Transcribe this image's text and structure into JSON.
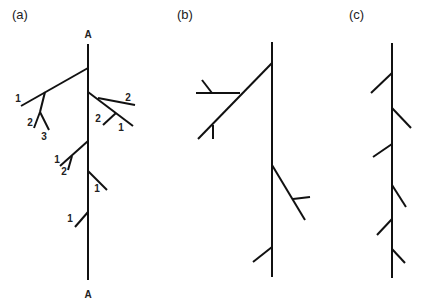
{
  "figure": {
    "stroke_color": "#111111",
    "background": "#ffffff",
    "panels": [
      {
        "id": "a",
        "label": "(a)",
        "label_pos": [
          12,
          19
        ],
        "axis_labels": [
          {
            "text": "A",
            "pos": [
              88,
              38
            ]
          },
          {
            "text": "A",
            "pos": [
              88,
              298
            ]
          }
        ],
        "segments": [
          {
            "role": "main-axis",
            "x1": 88,
            "y1": 44,
            "x2": 88,
            "y2": 280
          },
          {
            "role": "branch",
            "x1": 88,
            "y1": 68,
            "x2": 21,
            "y2": 106
          },
          {
            "role": "branch",
            "x1": 45,
            "y1": 92,
            "x2": 40,
            "y2": 112
          },
          {
            "role": "branch",
            "x1": 40,
            "y1": 112,
            "x2": 34,
            "y2": 128
          },
          {
            "role": "branch",
            "x1": 40,
            "y1": 112,
            "x2": 49,
            "y2": 130
          },
          {
            "role": "branch",
            "x1": 88,
            "y1": 92,
            "x2": 133,
            "y2": 126
          },
          {
            "role": "branch",
            "x1": 98,
            "y1": 98,
            "x2": 135,
            "y2": 105
          },
          {
            "role": "branch",
            "x1": 116,
            "y1": 113,
            "x2": 103,
            "y2": 125
          },
          {
            "role": "branch",
            "x1": 88,
            "y1": 141,
            "x2": 60,
            "y2": 166
          },
          {
            "role": "branch",
            "x1": 72,
            "y1": 156,
            "x2": 68,
            "y2": 170
          },
          {
            "role": "branch",
            "x1": 88,
            "y1": 171,
            "x2": 107,
            "y2": 190
          },
          {
            "role": "branch",
            "x1": 88,
            "y1": 212,
            "x2": 75,
            "y2": 227
          }
        ],
        "order_labels": [
          {
            "text": "1",
            "pos": [
              18,
              102
            ]
          },
          {
            "text": "2",
            "pos": [
              30,
              126
            ]
          },
          {
            "text": "3",
            "pos": [
              44,
              140
            ]
          },
          {
            "text": "2",
            "pos": [
              128,
              101
            ]
          },
          {
            "text": "2",
            "pos": [
              98,
              122
            ]
          },
          {
            "text": "1",
            "pos": [
              121,
              131
            ]
          },
          {
            "text": "1",
            "pos": [
              57,
              163
            ]
          },
          {
            "text": "2",
            "pos": [
              64,
              175
            ]
          },
          {
            "text": "1",
            "pos": [
              97,
              192
            ]
          },
          {
            "text": "1",
            "pos": [
              70,
              222
            ]
          }
        ]
      },
      {
        "id": "b",
        "label": "(b)",
        "label_pos": [
          177,
          19
        ],
        "axis_labels": [],
        "segments": [
          {
            "role": "main-axis",
            "x1": 272,
            "y1": 42,
            "x2": 272,
            "y2": 277
          },
          {
            "role": "branch",
            "x1": 272,
            "y1": 63,
            "x2": 198,
            "y2": 139
          },
          {
            "role": "branch",
            "x1": 240,
            "y1": 93,
            "x2": 196,
            "y2": 93
          },
          {
            "role": "branch",
            "x1": 212,
            "y1": 93,
            "x2": 202,
            "y2": 80
          },
          {
            "role": "branch",
            "x1": 213,
            "y1": 125,
            "x2": 213,
            "y2": 139
          },
          {
            "role": "branch",
            "x1": 272,
            "y1": 165,
            "x2": 305,
            "y2": 220
          },
          {
            "role": "branch",
            "x1": 293,
            "y1": 199,
            "x2": 310,
            "y2": 197
          },
          {
            "role": "branch",
            "x1": 272,
            "y1": 247,
            "x2": 253,
            "y2": 262
          }
        ],
        "order_labels": []
      },
      {
        "id": "c",
        "label": "(c)",
        "label_pos": [
          349,
          19
        ],
        "axis_labels": [],
        "segments": [
          {
            "role": "main-axis",
            "x1": 392,
            "y1": 43,
            "x2": 392,
            "y2": 278
          },
          {
            "role": "branch",
            "x1": 392,
            "y1": 73,
            "x2": 371,
            "y2": 93
          },
          {
            "role": "branch",
            "x1": 392,
            "y1": 108,
            "x2": 411,
            "y2": 128
          },
          {
            "role": "branch",
            "x1": 392,
            "y1": 144,
            "x2": 373,
            "y2": 157
          },
          {
            "role": "branch",
            "x1": 392,
            "y1": 185,
            "x2": 406,
            "y2": 207
          },
          {
            "role": "branch",
            "x1": 392,
            "y1": 219,
            "x2": 377,
            "y2": 235
          },
          {
            "role": "branch",
            "x1": 392,
            "y1": 249,
            "x2": 405,
            "y2": 263
          }
        ],
        "order_labels": []
      }
    ]
  }
}
